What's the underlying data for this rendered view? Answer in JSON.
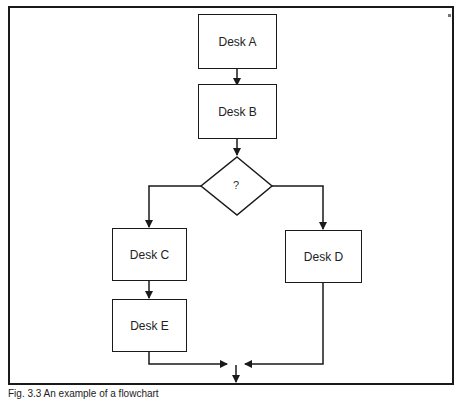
{
  "diagram": {
    "type": "flowchart",
    "nodes": {
      "desk_a": "Desk A",
      "desk_b": "Desk B",
      "decision": "?",
      "desk_c": "Desk C",
      "desk_d": "Desk D",
      "desk_e": "Desk E"
    },
    "edges": [
      [
        "Desk A",
        "Desk B"
      ],
      [
        "Desk B",
        "?"
      ],
      [
        "?",
        "Desk C"
      ],
      [
        "?",
        "Desk D"
      ],
      [
        "Desk C",
        "Desk E"
      ],
      [
        "Desk E",
        "merge"
      ],
      [
        "Desk D",
        "merge"
      ]
    ]
  },
  "caption": "Fig. 3.3 An example of a flowchart"
}
